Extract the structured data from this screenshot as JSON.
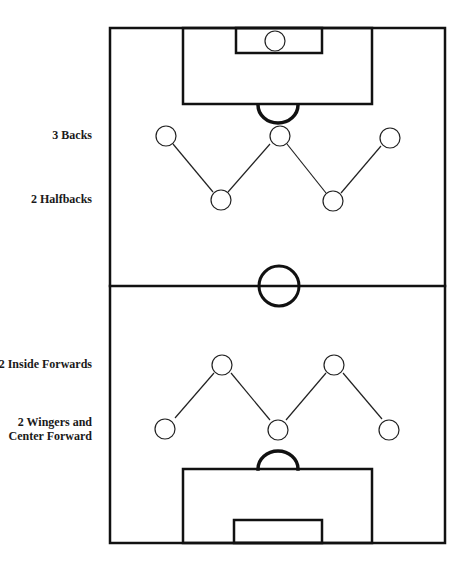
{
  "diagram": {
    "title": "",
    "labels": [
      {
        "id": "backs",
        "lines": [
          "3 Backs"
        ],
        "right": 92,
        "top": 128
      },
      {
        "id": "halfbacks",
        "lines": [
          "2 Halfbacks"
        ],
        "right": 92,
        "top": 192
      },
      {
        "id": "inside-forwards",
        "lines": [
          "2 Inside Forwards"
        ],
        "right": 92,
        "top": 357
      },
      {
        "id": "wingers-center",
        "lines": [
          "2 Wingers and",
          "Center Forward"
        ],
        "right": 92,
        "top": 415
      }
    ],
    "text": {
      "backs": "3 Backs",
      "halfbacks": "2 Halfbacks",
      "inside_forwards": "2 Inside Forwards",
      "wingers_line1": "2 Wingers and",
      "wingers_line2": "Center Forward"
    },
    "colors": {
      "line": "#111111",
      "background": "#ffffff"
    },
    "field": {
      "x1": 110,
      "y1": 28,
      "x2": 445,
      "y2": 543,
      "halfway_y": 286
    },
    "players": {
      "goalkeeper": [
        {
          "x": 275,
          "y": 41
        }
      ],
      "backs": [
        {
          "x": 166,
          "y": 136
        },
        {
          "x": 280,
          "y": 136
        },
        {
          "x": 390,
          "y": 138
        }
      ],
      "halfbacks": [
        {
          "x": 221,
          "y": 200
        },
        {
          "x": 333,
          "y": 201
        }
      ],
      "inside_forwards": [
        {
          "x": 222,
          "y": 365
        },
        {
          "x": 334,
          "y": 365
        }
      ],
      "wingers_center": [
        {
          "x": 165,
          "y": 429
        },
        {
          "x": 278,
          "y": 430
        },
        {
          "x": 389,
          "y": 430
        }
      ]
    }
  }
}
